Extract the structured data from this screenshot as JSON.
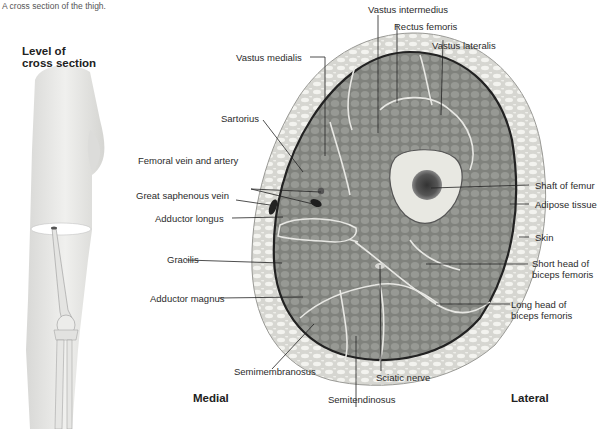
{
  "caption": "A cross section of the thigh.",
  "inset": {
    "title_line1": "Level of",
    "title_line2": "cross section"
  },
  "orientation": {
    "medial": "Medial",
    "lateral": "Lateral"
  },
  "labels": {
    "vastus_intermedius": "Vastus intermedius",
    "rectus_femoris": "Rectus femoris",
    "vastus_lateralis": "Vastus lateralis",
    "vastus_medialis": "Vastus medialis",
    "sartorius": "Sartorius",
    "femoral_vein_artery": "Femoral vein and artery",
    "great_saphenous_vein": "Great saphenous vein",
    "adductor_longus": "Adductor longus",
    "gracilis": "Gracilis",
    "adductor_magnus": "Adductor magnus",
    "semimembranosus": "Semimembranosus",
    "semitendinosus": "Semitendinosus",
    "sciatic_nerve": "Sciatic nerve",
    "shaft_of_femur": "Shaft of femur",
    "adipose_tissue": "Adipose tissue",
    "skin": "Skin",
    "short_head_line1": "Short head of",
    "short_head_line2": "biceps femoris",
    "long_head_line1": "Long head of",
    "long_head_line2": "biceps femoris"
  },
  "colors": {
    "skin_fat": "#d9d9d4",
    "fat_cells": "#f2f2ee",
    "muscle": "#8f918c",
    "muscle_dark": "#6f716c",
    "bone": "#e6e6e0",
    "marrow": "#4a4a48",
    "fascia": "#2d2d2d",
    "leg": "#e8e8e6"
  }
}
